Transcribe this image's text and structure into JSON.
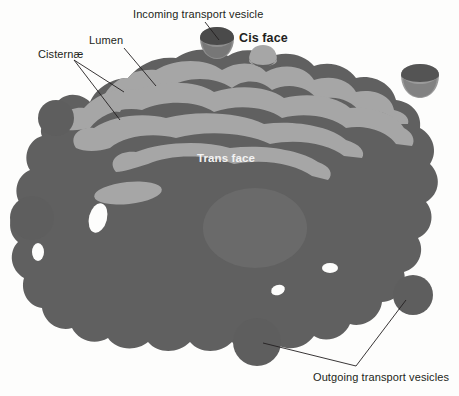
{
  "figure": {
    "background_color": "#fdfdfc",
    "colors": {
      "cisterna_light": "#a6a6a6",
      "lumen_dark": "#5f5f5f",
      "trans_body": "#606060",
      "vesicle": "#5e5e5e",
      "vesicle_rim": "#4a4a4a",
      "leader_line": "#231f20",
      "label_text": "#231f20",
      "label_text_inverse": "#f2f2f2"
    }
  },
  "labels": {
    "cisternae": "Cisternæ",
    "lumen": "Lumen",
    "incoming": "Incoming transport vesicle",
    "cis_face": "Cis face",
    "trans_face": "Trans face",
    "outgoing": "Outgoing transport vesicles"
  },
  "structures": {
    "cis_face_bud": "cis-face-budding-vesicle",
    "incoming_vesicle": "incoming-transport-vesicle-dome",
    "right_dome_vesicle": "right-dome-vesicle",
    "free_vesicles": [
      "vesicle-upper-left",
      "vesicle-mid-left",
      "vesicle-lower-center",
      "vesicle-lower-right"
    ],
    "cisternae_count": 4,
    "lumen_band_count": 4
  },
  "leader_lines": {
    "cisternae_targets": 2,
    "lumen_targets": 1,
    "incoming_targets": 1,
    "outgoing_targets": 2
  }
}
